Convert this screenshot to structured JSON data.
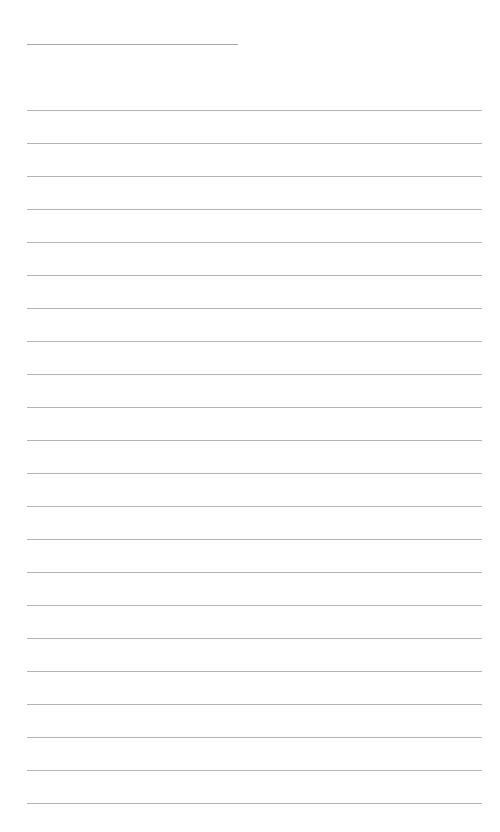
{
  "page": {
    "type": "lined-notepaper",
    "background_color": "#ffffff",
    "line_color": "#b4b4b4",
    "header_line": {
      "label": "",
      "x": 27,
      "y": 44,
      "width": 211
    },
    "ruled_lines": {
      "count": 22,
      "first_y": 110,
      "spacing": 33,
      "x": 27,
      "width": 455
    }
  }
}
